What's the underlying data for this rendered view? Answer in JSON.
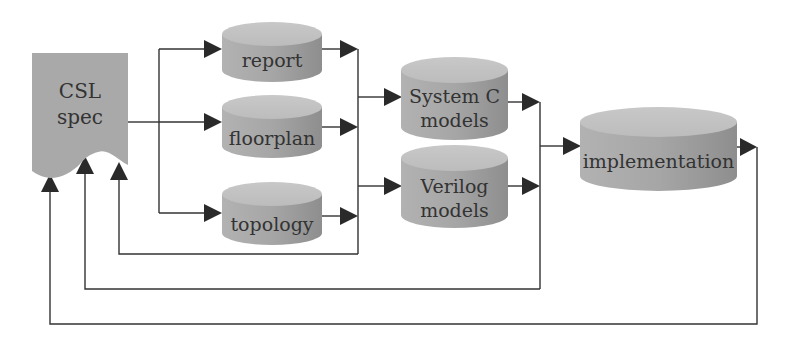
{
  "diagram": {
    "colors": {
      "node_fill": "#a8a8a8",
      "node_top": "#c4c4c4",
      "doc_fill": "#a9a9a9",
      "edge": "#333333",
      "background": "#ffffff"
    },
    "nodes": {
      "csl_spec": {
        "line1": "CSL",
        "line2": "spec",
        "shape": "document"
      },
      "report": {
        "label": "report",
        "shape": "cylinder"
      },
      "floorplan": {
        "label": "floorplan",
        "shape": "cylinder"
      },
      "topology": {
        "label": "topology",
        "shape": "cylinder"
      },
      "systemc": {
        "line1": "System C",
        "line2": "models",
        "shape": "cylinder"
      },
      "verilog": {
        "line1": "Verilog",
        "line2": "models",
        "shape": "cylinder"
      },
      "implementation": {
        "label": "implementation",
        "shape": "cylinder"
      }
    },
    "edges": [
      {
        "from": "csl_spec",
        "to": "report"
      },
      {
        "from": "csl_spec",
        "to": "floorplan"
      },
      {
        "from": "csl_spec",
        "to": "topology"
      },
      {
        "from": "report",
        "to": "systemc"
      },
      {
        "from": "floorplan",
        "to": "systemc"
      },
      {
        "from": "topology",
        "to": "systemc"
      },
      {
        "from": "report",
        "to": "verilog"
      },
      {
        "from": "floorplan",
        "to": "verilog"
      },
      {
        "from": "topology",
        "to": "verilog"
      },
      {
        "from": "topology",
        "to": "csl_spec",
        "type": "feedback"
      },
      {
        "from": "systemc",
        "to": "implementation"
      },
      {
        "from": "verilog",
        "to": "implementation"
      },
      {
        "from": "verilog",
        "to": "csl_spec",
        "type": "feedback"
      },
      {
        "from": "implementation",
        "to": "csl_spec",
        "type": "feedback"
      }
    ]
  }
}
